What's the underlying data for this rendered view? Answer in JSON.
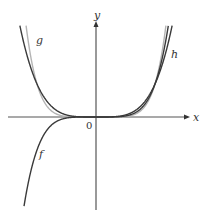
{
  "chart_data": {
    "type": "line",
    "title": "",
    "xlabel": "x",
    "ylabel": "y",
    "origin_label": "0",
    "grid": false,
    "legend": "inline labels",
    "series": [
      {
        "name": "f",
        "function": "x^5",
        "color": "#3a3a3a"
      },
      {
        "name": "g",
        "function": "x^6",
        "color": "#b4b4b4"
      },
      {
        "name": "h",
        "function": "x^4",
        "color": "#3a3a3a"
      }
    ],
    "intersections": [
      [
        0,
        0
      ],
      [
        1,
        1
      ]
    ],
    "xlim": [
      -1.3,
      1.3
    ],
    "ylim": [
      -2.7,
      2.9
    ]
  },
  "labels": {
    "x_axis": "x",
    "y_axis": "y",
    "origin": "0",
    "f": "f",
    "g": "g",
    "h": "h"
  },
  "colors": {
    "axis": "#555555",
    "dark_curve": "#3a3a3a",
    "light_curve": "#b4b4b4"
  }
}
